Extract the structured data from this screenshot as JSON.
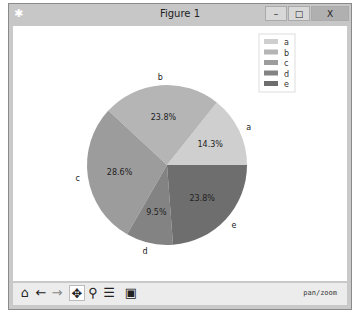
{
  "window": {
    "title": "Figure 1",
    "controls": {
      "minimize": "–",
      "maximize": "□",
      "close": "X"
    }
  },
  "toolbar": {
    "buttons": [
      {
        "name": "home",
        "glyph": "⌂"
      },
      {
        "name": "back",
        "glyph": "←"
      },
      {
        "name": "forward",
        "glyph": "→"
      },
      {
        "name": "pan",
        "glyph": "✥"
      },
      {
        "name": "zoom",
        "glyph": "⚲"
      },
      {
        "name": "configure-subplots",
        "glyph": "☰"
      },
      {
        "name": "save",
        "glyph": "▣"
      }
    ],
    "status": "pan/zoom"
  },
  "chart_data": {
    "type": "pie",
    "labels": [
      "a",
      "b",
      "c",
      "d",
      "e"
    ],
    "values": [
      14.3,
      23.8,
      28.6,
      9.5,
      23.8
    ],
    "autopct": [
      "14.3%",
      "23.8%",
      "28.6%",
      "9.5%",
      "23.8%"
    ],
    "colors": [
      "#cfcfcf",
      "#b5b5b5",
      "#9c9c9c",
      "#838383",
      "#6e6e6e"
    ],
    "startangle": 0,
    "legend": {
      "position": "upper right",
      "entries": [
        "a",
        "b",
        "c",
        "d",
        "e"
      ]
    }
  }
}
